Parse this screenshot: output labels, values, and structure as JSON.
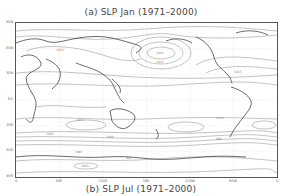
{
  "figure": {
    "title_top": "(a) SLP Jan (1971–2000)",
    "title_bottom": "(b) SLP Jul (1971–2000)"
  },
  "map": {
    "projection": "cylindrical equidistant",
    "variable": "Sea Level Pressure (hPa)",
    "y_ticks": [
      "90N",
      "60N",
      "30N",
      "EQ",
      "30S",
      "60S",
      "90S"
    ],
    "x_ticks": [
      "0",
      "60E",
      "120E",
      "180",
      "120W",
      "60W",
      "0"
    ],
    "contour_labels": [
      "1000",
      "1005",
      "1010",
      "1015",
      "1020",
      "1025",
      "990",
      "985"
    ],
    "colors": {
      "frame": "#555555",
      "contour": "#999999",
      "coastline": "#222222",
      "grid": "#cccccc",
      "text": "#444444"
    }
  }
}
